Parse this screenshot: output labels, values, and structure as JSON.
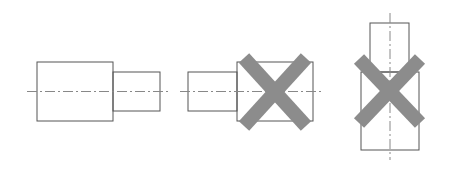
{
  "diagram": {
    "colors": {
      "outline": "#555555",
      "centerline": "#888888",
      "cross": "#8c8c8c",
      "background": "#ffffff"
    },
    "figures": [
      {
        "id": "correct-horizontal",
        "crossed_out": false
      },
      {
        "id": "incorrect-mirrored",
        "crossed_out": true
      },
      {
        "id": "incorrect-vertical",
        "crossed_out": true
      }
    ]
  }
}
